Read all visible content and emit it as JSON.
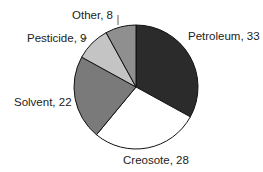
{
  "chart_data": {
    "type": "pie",
    "title": "",
    "categories": [
      "Petroleum",
      "Creosote",
      "Solvent",
      "Pesticide",
      "Other"
    ],
    "values": [
      33,
      28,
      22,
      9,
      8
    ],
    "colors": [
      "#2b2b2b",
      "#ffffff",
      "#7a7a7a",
      "#c4c4c4",
      "#8f8f8f"
    ],
    "labels": [
      "Petroleum, 33",
      "Creosote, 28",
      "Solvent, 22",
      "Pesticide, 9",
      "Other, 8"
    ],
    "start_angle": "top",
    "direction": "clockwise"
  }
}
